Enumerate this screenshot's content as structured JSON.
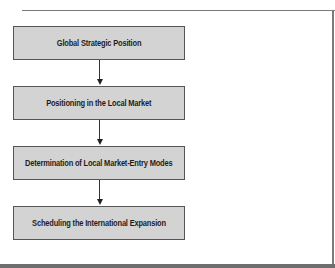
{
  "diagram": {
    "type": "flowchart",
    "direction": "top-to-bottom",
    "steps": [
      {
        "label": "Global Strategic Position"
      },
      {
        "label": "Positioning in the Local Market"
      },
      {
        "label": "Determination of Local Market-Entry Modes"
      },
      {
        "label": "Scheduling the International Expansion"
      }
    ],
    "connectors": [
      {
        "from": 0,
        "to": 1,
        "icon": "arrow-down-icon"
      },
      {
        "from": 1,
        "to": 2,
        "icon": "arrow-down-icon"
      },
      {
        "from": 2,
        "to": 3,
        "icon": "arrow-down-icon"
      }
    ],
    "colors": {
      "box_fill": "#d3d3d3",
      "box_border": "#555555",
      "text": "#1e1e1e",
      "frame": "#7a7a7a",
      "arrow": "#222222"
    }
  }
}
